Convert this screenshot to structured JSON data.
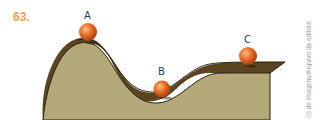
{
  "question_number": "63.",
  "labels": {
    "a": "A",
    "b": "B",
    "c": "C"
  },
  "credit": "co de imagens/Arquivo da editora",
  "colors": {
    "question_number": "#f0a050",
    "terrain_face": "#b2a878",
    "terrain_top": "#5a4520",
    "outline": "#2a2010",
    "ball": "#e0702a",
    "label": "#1e3a5f"
  }
}
